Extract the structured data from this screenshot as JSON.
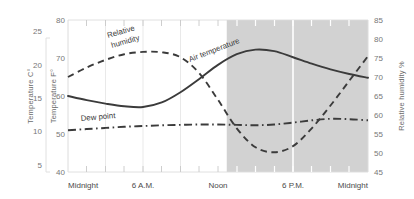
{
  "chart_data": {
    "type": "line",
    "title": "",
    "xlabel": "",
    "ylabel": "Temperature F°",
    "grid": true,
    "legend_position": "inline-labels",
    "x_tick_labels": [
      "Midnight",
      "6 A.M.",
      "Noon",
      "6 P.M.",
      "Midnight"
    ],
    "x_tick_hours": [
      0,
      6,
      12,
      18,
      24
    ],
    "xlim": [
      0,
      24
    ],
    "axes": {
      "left_outer": {
        "label": "Temperature C°",
        "ticks": [
          5,
          10,
          15,
          20,
          25
        ],
        "lim": [
          3.9,
          26.7
        ],
        "unit": "C"
      },
      "left_inner": {
        "label": "Temperature F°",
        "ticks": [
          40,
          50,
          60,
          70,
          80
        ],
        "lim": [
          40,
          80
        ],
        "unit": "F"
      },
      "right": {
        "label": "Relative humidity %",
        "ticks": [
          45,
          50,
          55,
          60,
          65,
          70,
          75,
          80,
          85
        ],
        "lim": [
          45,
          85
        ],
        "unit": "%"
      }
    },
    "shaded_region": {
      "label": "afternoon-evening shading",
      "x_start_hour": 12.7,
      "x_end_hour": 24,
      "color": "#d2d2d2"
    },
    "series": [
      {
        "name": "Air temperature",
        "axis": "left_inner",
        "style": "solid",
        "color": "#3b3b3b",
        "x": [
          0,
          1.5,
          3,
          4.5,
          6,
          7.5,
          9,
          10.5,
          12,
          13.5,
          15,
          16.5,
          18,
          19.5,
          21,
          22.5,
          24
        ],
        "values": [
          60.0,
          58.9,
          58.0,
          57.3,
          57.1,
          58.3,
          61.0,
          64.5,
          68.2,
          71.0,
          72.2,
          71.8,
          70.2,
          68.5,
          67.0,
          65.8,
          64.8
        ]
      },
      {
        "name": "Relative humidity",
        "axis": "right",
        "style": "dashed",
        "color": "#3b3b3b",
        "x": [
          0,
          1.5,
          3,
          4.5,
          6,
          7.5,
          9,
          10.5,
          12,
          13.5,
          15,
          16.5,
          18,
          19.5,
          21,
          22.5,
          24
        ],
        "values": [
          70.0,
          72.5,
          74.5,
          76.0,
          76.6,
          76.5,
          75.2,
          71.0,
          64.0,
          56.5,
          51.5,
          50.2,
          51.8,
          56.5,
          62.5,
          69.0,
          75.5
        ]
      },
      {
        "name": "Dew point",
        "axis": "left_inner",
        "style": "dash-dot",
        "color": "#3b3b3b",
        "x": [
          0,
          1.5,
          3,
          4.5,
          6,
          7.5,
          9,
          10.5,
          12,
          13.5,
          15,
          16.5,
          18,
          19.5,
          21,
          22.5,
          24
        ],
        "values": [
          51.0,
          51.3,
          51.6,
          51.9,
          52.1,
          52.3,
          52.4,
          52.5,
          52.5,
          52.4,
          52.3,
          52.5,
          53.0,
          53.6,
          54.0,
          53.9,
          53.6
        ]
      }
    ],
    "annotations": [
      {
        "name": "relative-humidity-label",
        "text_line1": "Relative",
        "text_line2": "humidity",
        "x": 108,
        "y": 38,
        "rotation": -16
      },
      {
        "name": "air-temperature-label",
        "text": "Air temperature",
        "x": 190,
        "y": 62,
        "rotation": -21
      },
      {
        "name": "dew-point-label",
        "text": "Dew point",
        "x": 81,
        "y": 121,
        "rotation": -5
      }
    ]
  }
}
